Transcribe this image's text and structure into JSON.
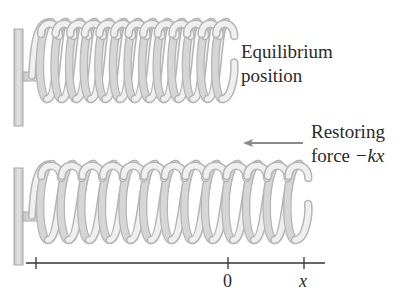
{
  "figure": {
    "top_panel": {
      "label_line1": "Equilibrium",
      "label_line2": "position",
      "coil_count": 13
    },
    "bottom_panel": {
      "label_line1": "Restoring",
      "label_line2_prefix": "force ",
      "label_line2_math": "−kx",
      "arrow_direction": "left",
      "coil_count": 13
    },
    "axis": {
      "ticks": [
        {
          "label": ""
        },
        {
          "label": "0"
        },
        {
          "label": "x"
        }
      ]
    },
    "colors": {
      "spring_fill": "#d6d6d6",
      "spring_highlight": "#efefef",
      "spring_outline": "#b5b5b5",
      "wall_fill": "#d2d2d2",
      "wall_outline": "#a8a8a8",
      "axis": "#333333",
      "arrow": "#8a8a8a",
      "text": "#2a2a2a"
    }
  }
}
